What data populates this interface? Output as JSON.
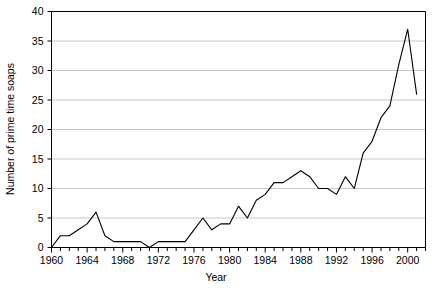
{
  "chart_data": {
    "type": "line",
    "title": "",
    "xlabel": "Year",
    "ylabel": "Number of prime time soaps",
    "xlim": [
      1960,
      2002
    ],
    "ylim": [
      0,
      40
    ],
    "ytick_step": 5,
    "yticks": [
      0,
      5,
      10,
      15,
      20,
      25,
      30,
      35,
      40
    ],
    "ytick_labels": [
      "0",
      "5",
      "10",
      "15",
      "20",
      "25",
      "30",
      "35",
      "40"
    ],
    "xtick_step": 1,
    "xtick_label_step": 4,
    "xtick_labels": [
      "1960",
      "1964",
      "1968",
      "1972",
      "1976",
      "1980",
      "1984",
      "1988",
      "1992",
      "1996",
      "2000"
    ],
    "xtick_label_years": [
      1960,
      1964,
      1968,
      1972,
      1976,
      1980,
      1984,
      1988,
      1992,
      1996,
      2000
    ],
    "grid": "horizontal",
    "grid_color": "#c8c8c8",
    "axis_color": "#000000",
    "line_color": "#000000",
    "line_width": 1.1,
    "legend": "none",
    "markers": "none",
    "x": [
      1960,
      1961,
      1962,
      1963,
      1964,
      1965,
      1966,
      1967,
      1968,
      1969,
      1970,
      1971,
      1972,
      1973,
      1974,
      1975,
      1976,
      1977,
      1978,
      1979,
      1980,
      1981,
      1982,
      1983,
      1984,
      1985,
      1986,
      1987,
      1988,
      1989,
      1990,
      1991,
      1992,
      1993,
      1994,
      1995,
      1996,
      1997,
      1998,
      1999,
      2000,
      2001
    ],
    "values": [
      0,
      2,
      2,
      3,
      4,
      6,
      2,
      1,
      1,
      1,
      1,
      0,
      1,
      1,
      1,
      1,
      3,
      5,
      3,
      4,
      4,
      7,
      5,
      8,
      9,
      11,
      11,
      12,
      13,
      12,
      10,
      10,
      9,
      12,
      10,
      16,
      18,
      22,
      24,
      31,
      37,
      26
    ],
    "series": [
      {
        "name": "Number of prime time soaps",
        "values": [
          0,
          2,
          2,
          3,
          4,
          6,
          2,
          1,
          1,
          1,
          1,
          0,
          1,
          1,
          1,
          1,
          3,
          5,
          3,
          4,
          4,
          7,
          5,
          8,
          9,
          11,
          11,
          12,
          13,
          12,
          10,
          10,
          9,
          12,
          10,
          16,
          18,
          22,
          24,
          31,
          37,
          26
        ]
      }
    ],
    "peak": {
      "year": 2000,
      "value": 37
    },
    "minimums": [
      {
        "year": 1960,
        "value": 0
      },
      {
        "year": 1971,
        "value": 0
      }
    ]
  }
}
